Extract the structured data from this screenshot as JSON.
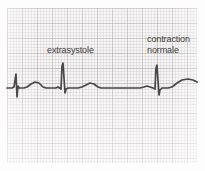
{
  "figure": {
    "kind": "ecg-strip",
    "language": "fr",
    "width": 205,
    "height": 171,
    "paper_color": "#f7f6f6",
    "grid_major_color": "#b0a6a8",
    "grid_minor_color": "#c6bec0",
    "trace_color": "#4a4749",
    "label_color": "#3b3b3b"
  },
  "annotations": {
    "extrasystole": "extrasystole",
    "contraction_normale": "contraction\nnormale"
  },
  "chart_data": {
    "type": "line",
    "title": "",
    "xlabel": "",
    "ylabel": "",
    "grid": true,
    "legend": "none",
    "baseline_y": 88,
    "xlim": [
      0,
      205
    ],
    "ylim": [
      171,
      0
    ],
    "series": [
      {
        "name": "ecg-trace",
        "color": "#4a4749",
        "points": [
          [
            7,
            88
          ],
          [
            12,
            88
          ],
          [
            14,
            87
          ],
          [
            16,
            74
          ],
          [
            17,
            97
          ],
          [
            18,
            86
          ],
          [
            19,
            88
          ],
          [
            24,
            88
          ],
          [
            27,
            87
          ],
          [
            31,
            84
          ],
          [
            35,
            82
          ],
          [
            39,
            83
          ],
          [
            43,
            87
          ],
          [
            46,
            88
          ],
          [
            56,
            88
          ],
          [
            58,
            87
          ],
          [
            61,
            89
          ],
          [
            62,
            66
          ],
          [
            63,
            63
          ],
          [
            65,
            93
          ],
          [
            66,
            89
          ],
          [
            68,
            88
          ],
          [
            78,
            88
          ],
          [
            82,
            87
          ],
          [
            86,
            85
          ],
          [
            90,
            83
          ],
          [
            94,
            84
          ],
          [
            98,
            87
          ],
          [
            101,
            88
          ],
          [
            140,
            88
          ],
          [
            144,
            87
          ],
          [
            147,
            86
          ],
          [
            150,
            87
          ],
          [
            153,
            88
          ],
          [
            155,
            89
          ],
          [
            156,
            68
          ],
          [
            157,
            65
          ],
          [
            159,
            95
          ],
          [
            160,
            90
          ],
          [
            162,
            88
          ],
          [
            168,
            88
          ],
          [
            172,
            87
          ],
          [
            177,
            83
          ],
          [
            182,
            80
          ],
          [
            188,
            79
          ],
          [
            193,
            80
          ],
          [
            197,
            82
          ]
        ],
        "features": [
          {
            "name": "partial-qrs",
            "x": 17,
            "label": ""
          },
          {
            "name": "t-wave",
            "x": 35,
            "label": ""
          },
          {
            "name": "extrasystole-qrs",
            "x": 63,
            "label": "extrasystole"
          },
          {
            "name": "t-wave",
            "x": 90,
            "label": ""
          },
          {
            "name": "compensatory-pause",
            "x": 120,
            "label": ""
          },
          {
            "name": "p-wave",
            "x": 147,
            "label": ""
          },
          {
            "name": "normal-qrs",
            "x": 157,
            "label": "contraction normale"
          },
          {
            "name": "t-wave",
            "x": 188,
            "label": ""
          }
        ]
      }
    ]
  }
}
